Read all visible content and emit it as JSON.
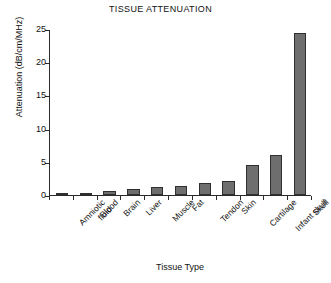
{
  "chart_data": {
    "type": "bar",
    "title": "TISSUE ATTENUATION",
    "xlabel": "Tissue Type",
    "ylabel": "Attenuation (dB/cm/MHz)",
    "categories": [
      "Amniotic\nfluid",
      "Blood",
      "Brain",
      "Liver",
      "Muscle",
      "Fat",
      "Tendon",
      "Skin",
      "Cartilage",
      "Infant skull",
      "Skull"
    ],
    "values": [
      0.1,
      0.2,
      0.6,
      0.9,
      1.2,
      1.3,
      1.8,
      2.1,
      4.6,
      6.0,
      24.6
    ],
    "ylim": [
      0,
      25
    ],
    "yticks": [
      0,
      5,
      10,
      15,
      20,
      25
    ],
    "ytick_labels": [
      "0",
      "5",
      "10",
      "15",
      "20",
      "25"
    ],
    "grid": false,
    "legend": false,
    "bar_color": "#6e6e6e",
    "bar_edge_color": "#2f2f2f",
    "axis_color": "#2a2a2a",
    "background": "#ffffff"
  }
}
